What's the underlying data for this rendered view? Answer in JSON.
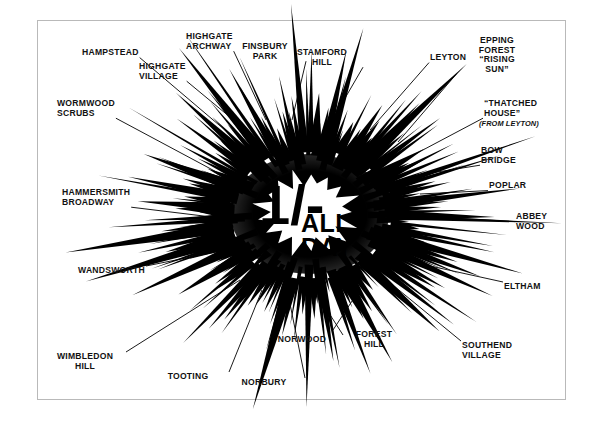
{
  "poster": {
    "title": "1/- ALL DAY",
    "center": {
      "price": "1/-",
      "line1": "ALL",
      "line2": "DAY"
    },
    "ink_color": "#000000",
    "paper_color": "#ffffff",
    "frame_color": "#b9b9b9"
  },
  "destinations": [
    {
      "id": "hampstead",
      "lines": [
        "HAMPSTEAD"
      ],
      "x": 82,
      "y": 48,
      "align": "left",
      "tip_x": 232,
      "tip_y": 136
    },
    {
      "id": "highgate-village",
      "lines": [
        "HIGHGATE",
        "VILLAGE"
      ],
      "x": 139,
      "y": 62,
      "align": "left",
      "tip_x": 248,
      "tip_y": 132
    },
    {
      "id": "highgate-archway",
      "lines": [
        "HIGHGATE",
        "ARCHWAY"
      ],
      "x": 186,
      "y": 32,
      "align": "left",
      "tip_x": 266,
      "tip_y": 120
    },
    {
      "id": "finsbury-park",
      "lines": [
        "FINSBURY",
        "PARK"
      ],
      "x": 265,
      "y": 42,
      "align": "center",
      "tip_x": 292,
      "tip_y": 120
    },
    {
      "id": "stamford-hill",
      "lines": [
        "STAMFORD",
        "HILL"
      ],
      "x": 322,
      "y": 48,
      "align": "center",
      "tip_x": 330,
      "tip_y": 124
    },
    {
      "id": "leyton",
      "lines": [
        "LEYTON"
      ],
      "x": 430,
      "y": 53,
      "align": "left",
      "tip_x": 370,
      "tip_y": 130
    },
    {
      "id": "epping-forest",
      "lines": [
        "EPPING",
        "FOREST",
        "“RISING",
        "SUN”"
      ],
      "x": 497,
      "y": 36,
      "align": "center",
      "tip_x": 398,
      "tip_y": 142
    },
    {
      "id": "thatched-house",
      "lines": [
        "“THATCHED",
        "HOUSE”"
      ],
      "x": 484,
      "y": 99,
      "align": "left",
      "tip_x": 404,
      "tip_y": 160
    },
    {
      "id": "thatched-house-sub",
      "lines": [
        "(FROM LEYTON)"
      ],
      "x": 479,
      "y": 119,
      "align": "left",
      "italic": true
    },
    {
      "id": "bow-bridge",
      "lines": [
        "BOW",
        "BRIDGE"
      ],
      "x": 481,
      "y": 146,
      "align": "left",
      "tip_x": 412,
      "tip_y": 176
    },
    {
      "id": "poplar",
      "lines": [
        "POPLAR"
      ],
      "x": 489,
      "y": 181,
      "align": "left",
      "tip_x": 420,
      "tip_y": 194
    },
    {
      "id": "abbey-wood",
      "lines": [
        "ABBEY",
        "WOOD"
      ],
      "x": 516,
      "y": 212,
      "align": "left",
      "tip_x": 418,
      "tip_y": 216
    },
    {
      "id": "eltham",
      "lines": [
        "ELTHAM"
      ],
      "x": 504,
      "y": 282,
      "align": "left",
      "tip_x": 412,
      "tip_y": 262
    },
    {
      "id": "southend-village",
      "lines": [
        "SOUTHEND",
        "VILLAGE"
      ],
      "x": 462,
      "y": 341,
      "align": "left",
      "tip_x": 394,
      "tip_y": 286
    },
    {
      "id": "forest-hill",
      "lines": [
        "FOREST",
        "HILL"
      ],
      "x": 374,
      "y": 330,
      "align": "center",
      "tip_x": 358,
      "tip_y": 292
    },
    {
      "id": "norwood",
      "lines": [
        "NORWOOD"
      ],
      "x": 302,
      "y": 335,
      "align": "center",
      "tip_x": 318,
      "tip_y": 296
    },
    {
      "id": "norbury",
      "lines": [
        "NORBURY"
      ],
      "x": 264,
      "y": 378,
      "align": "center",
      "tip_x": 288,
      "tip_y": 294
    },
    {
      "id": "tooting",
      "lines": [
        "TOOTING"
      ],
      "x": 188,
      "y": 372,
      "align": "center",
      "tip_x": 262,
      "tip_y": 290
    },
    {
      "id": "wimbledon-hill",
      "lines": [
        "WIMBLEDON",
        "HILL"
      ],
      "x": 85,
      "y": 352,
      "align": "center",
      "tip_x": 240,
      "tip_y": 280
    },
    {
      "id": "wandsworth",
      "lines": [
        "WANDSWORTH"
      ],
      "x": 78,
      "y": 266,
      "align": "left",
      "tip_x": 226,
      "tip_y": 250
    },
    {
      "id": "hammersmith-broadway",
      "lines": [
        "HAMMERSMITH",
        "BROADWAY"
      ],
      "x": 62,
      "y": 188,
      "align": "left",
      "tip_x": 220,
      "tip_y": 218
    },
    {
      "id": "wormwood-scrubs",
      "lines": [
        "WORMWOOD",
        "SCRUBS"
      ],
      "x": 57,
      "y": 99,
      "align": "left",
      "tip_x": 224,
      "tip_y": 176
    }
  ]
}
